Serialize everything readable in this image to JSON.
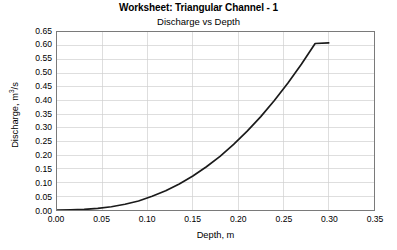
{
  "chart_data": {
    "type": "line",
    "title": "Worksheet: Triangular Channel - 1",
    "subtitle": "Discharge vs Depth",
    "xlabel": "Depth, m",
    "ylabel_text": "Discharge, m",
    "ylabel_sup": "3",
    "ylabel_unit": "/s",
    "ylabel_full": "Discharge, m3/s",
    "xlim": [
      0.0,
      0.35
    ],
    "ylim": [
      0.0,
      0.65
    ],
    "grid": true,
    "legend": "none",
    "xticks": [
      "0.00",
      "0.05",
      "0.10",
      "0.15",
      "0.20",
      "0.25",
      "0.30",
      "0.35"
    ],
    "xtick_values": [
      0.0,
      0.05,
      0.1,
      0.15,
      0.2,
      0.25,
      0.3,
      0.35
    ],
    "yticks": [
      "0.00",
      "0.05",
      "0.10",
      "0.15",
      "0.20",
      "0.25",
      "0.30",
      "0.35",
      "0.40",
      "0.45",
      "0.50",
      "0.55",
      "0.60",
      "0.65"
    ],
    "ytick_values": [
      0.0,
      0.05,
      0.1,
      0.15,
      0.2,
      0.25,
      0.3,
      0.35,
      0.4,
      0.45,
      0.5,
      0.55,
      0.6,
      0.65
    ],
    "series": [
      {
        "name": "Discharge vs Depth",
        "color": "#1a1a1a",
        "x": [
          0.0,
          0.015,
          0.03,
          0.045,
          0.06,
          0.075,
          0.09,
          0.105,
          0.12,
          0.135,
          0.15,
          0.165,
          0.18,
          0.195,
          0.21,
          0.225,
          0.24,
          0.255,
          0.27,
          0.285,
          0.3
        ],
        "y": [
          0.0,
          0.001,
          0.002,
          0.006,
          0.012,
          0.021,
          0.033,
          0.05,
          0.07,
          0.095,
          0.124,
          0.158,
          0.196,
          0.24,
          0.288,
          0.341,
          0.4,
          0.464,
          0.533,
          0.608,
          0.61
        ]
      }
    ]
  },
  "colors": {
    "curve": "#1a1a1a",
    "grid": "#d0d0d0",
    "frame": "#7a7a7a",
    "background": "#ffffff"
  }
}
